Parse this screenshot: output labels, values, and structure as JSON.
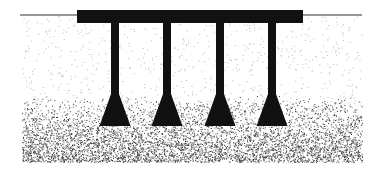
{
  "diagram": {
    "title": "",
    "type": "pile foundation cross-section",
    "ground_line": {
      "x1": 20,
      "x2": 362,
      "y": 15
    },
    "pile_cap": {
      "x": 77,
      "y": 10,
      "width": 226,
      "height": 13,
      "color": "#111111"
    },
    "piles": [
      {
        "label": "",
        "cx": 115
      },
      {
        "label": "",
        "cx": 167
      },
      {
        "label": "",
        "cx": 220
      },
      {
        "label": "",
        "cx": 272
      }
    ],
    "pile_shaft": {
      "width": 8,
      "top": 23,
      "flare_start": 94,
      "base": 126,
      "base_width": 31
    },
    "soil": {
      "light_color": "#bbbbbb",
      "dense_color": "#333333",
      "dense_zone_top": 120,
      "dense_zone_bottom": 162
    }
  }
}
